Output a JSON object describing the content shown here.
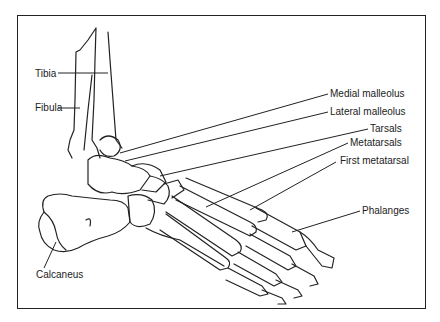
{
  "diagram": {
    "labels": [
      {
        "id": "tibia",
        "text": "Tibia"
      },
      {
        "id": "fibula",
        "text": "Fibula"
      },
      {
        "id": "medial_malleolus",
        "text": "Medial malleolus"
      },
      {
        "id": "lateral_malleolus",
        "text": "Lateral malleolus"
      },
      {
        "id": "tarsals",
        "text": "Tarsals"
      },
      {
        "id": "metatarsals",
        "text": "Metatarsals"
      },
      {
        "id": "first_metatarsal",
        "text": "First metatarsal"
      },
      {
        "id": "phalanges",
        "text": "Phalanges"
      },
      {
        "id": "calcaneus",
        "text": "Calcaneus"
      }
    ],
    "colors": {
      "ink": "#222222",
      "background": "#ffffff"
    }
  }
}
